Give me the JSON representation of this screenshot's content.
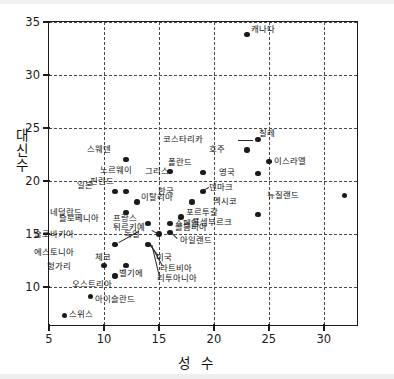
{
  "chart_data": {
    "type": "scatter",
    "title": "",
    "xlabel": "성 수",
    "ylabel": "대신수",
    "ylabel_chars": [
      "대",
      "신",
      "수"
    ],
    "xlim": [
      5,
      33.2
    ],
    "ylim": [
      6.2,
      35
    ],
    "xticks": [
      5,
      10,
      15,
      20,
      25,
      30
    ],
    "yticks": [
      10,
      15,
      20,
      25,
      30,
      35
    ],
    "xtick_labels": [
      "5",
      "10",
      "15",
      "20",
      "25",
      "30"
    ],
    "ytick_labels": [
      "10",
      "15",
      "20",
      "25",
      "30",
      "35"
    ],
    "grid": "dashed both axes",
    "legend": "none",
    "marker_color": "#1b1b1b",
    "axis_color": "#1a1a1a",
    "grid_color": "#4a4a4a",
    "points": [
      {
        "label": "캐나다",
        "x": 23.0,
        "y": 33.8,
        "lx": 0.4,
        "ly": 0.45,
        "leader": false
      },
      {
        "label": "칠레",
        "x": 24.0,
        "y": 23.9,
        "lx": 0.1,
        "ly": 0.55,
        "leader": false
      },
      {
        "label": "코스타리카",
        "x": 24.0,
        "y": 23.9,
        "lx": -4.9,
        "ly": 0.05,
        "leader": true
      },
      {
        "label": "호주",
        "x": 23.0,
        "y": 22.9,
        "lx": -1.9,
        "ly": 0.05,
        "leader": false
      },
      {
        "label": "스웨덴",
        "x": 12.0,
        "y": 22.0,
        "lx": -1.3,
        "ly": 0.95,
        "leader": false
      },
      {
        "label": "이스라엘",
        "x": 25.0,
        "y": 21.8,
        "lx": 0.5,
        "ly": 0.05,
        "leader": false
      },
      {
        "label": "폴란드",
        "x": 19.0,
        "y": 20.8,
        "lx": -0.9,
        "ly": 0.95,
        "leader": false
      },
      {
        "label": "노르웨이",
        "x": 16.0,
        "y": 20.9,
        "lx": -3.4,
        "ly": 0.05,
        "leader": false
      },
      {
        "label": "그리스",
        "x": 19.0,
        "y": 20.8,
        "lx": -3.0,
        "ly": 0.05,
        "leader": false
      },
      {
        "label": "영국",
        "x": 24.0,
        "y": 20.7,
        "lx": -2.0,
        "ly": 0.05,
        "leader": false
      },
      {
        "label": "덴마크",
        "x": 19.0,
        "y": 19.0,
        "lx": 0.6,
        "ly": 0.35,
        "leader": true
      },
      {
        "label": "일본",
        "x": 11.0,
        "y": 19.0,
        "lx": -1.9,
        "ly": 0.55,
        "leader": false
      },
      {
        "label": "핀란드",
        "x": 12.0,
        "y": 19.0,
        "lx": -1.0,
        "ly": 0.95,
        "leader": false
      },
      {
        "label": "뉴질랜드",
        "x": 31.9,
        "y": 18.6,
        "lx": -4.1,
        "ly": 0.05,
        "leader": false
      },
      {
        "label": "이탈리아",
        "x": 13.0,
        "y": 18.0,
        "lx": 0.4,
        "ly": 0.45,
        "leader": false
      },
      {
        "label": "한국",
        "x": 18.0,
        "y": 18.0,
        "lx": -1.5,
        "ly": 0.95,
        "leader": false
      },
      {
        "label": "멕시코",
        "x": 19.0,
        "y": 19.0,
        "lx": 0.9,
        "ly": -0.95,
        "leader": false
      },
      {
        "label": "네덜란드",
        "x": 12.0,
        "y": 17.0,
        "lx": -3.9,
        "ly": 0.05,
        "leader": false
      },
      {
        "label": "포르투갈",
        "x": 17.0,
        "y": 16.6,
        "lx": 0.45,
        "ly": 0.45,
        "leader": false
      },
      {
        "label": "룩셈부르크",
        "x": 24.0,
        "y": 16.8,
        "lx": -2.3,
        "ly": -0.75,
        "leader": false
      },
      {
        "label": "프랑스",
        "x": 16.0,
        "y": 16.0,
        "lx": -2.9,
        "ly": 0.45,
        "leader": false
      },
      {
        "label": "슬로베니아",
        "x": 14.0,
        "y": 16.0,
        "lx": -4.4,
        "ly": 0.45,
        "leader": false
      },
      {
        "label": "스페인",
        "x": 16.0,
        "y": 16.0,
        "lx": 0.45,
        "ly": -0.05,
        "leader": false
      },
      {
        "label": "콜롬비아",
        "x": 16.0,
        "y": 15.1,
        "lx": 0.45,
        "ly": 0.45,
        "leader": false
      },
      {
        "label": "튀르키예",
        "x": 15.0,
        "y": 15.0,
        "lx": -1.2,
        "ly": 0.6,
        "leader": true
      },
      {
        "label": "독일",
        "x": 15.0,
        "y": 15.0,
        "lx": -1.6,
        "ly": -0.05,
        "leader": false
      },
      {
        "label": "아일랜드",
        "x": 16.0,
        "y": 15.1,
        "lx": 0.9,
        "ly": -0.75,
        "leader": true
      },
      {
        "label": "슬로바키아",
        "x": 11.0,
        "y": 14.0,
        "lx": -3.6,
        "ly": 0.95,
        "leader": false
      },
      {
        "label": "미국",
        "x": 14.0,
        "y": 14.0,
        "lx": 0.7,
        "ly": -1.25,
        "leader": true
      },
      {
        "label": "라트비아",
        "x": 14.0,
        "y": 14.0,
        "lx": 1.1,
        "ly": -2.25,
        "leader": true
      },
      {
        "label": "리투아니아",
        "x": 14.0,
        "y": 14.0,
        "lx": 0.8,
        "ly": -3.25,
        "leader": true
      },
      {
        "label": "에스토니아",
        "x": 11.0,
        "y": 14.0,
        "lx": -3.6,
        "ly": -0.75,
        "leader": false
      },
      {
        "label": "체코",
        "x": 12.0,
        "y": 12.0,
        "lx": -1.3,
        "ly": 0.75,
        "leader": false
      },
      {
        "label": "헝가리",
        "x": 10.0,
        "y": 12.0,
        "lx": -2.9,
        "ly": -0.05,
        "leader": false
      },
      {
        "label": "벨기에",
        "x": 11.0,
        "y": 11.0,
        "lx": 0.4,
        "ly": 0.25,
        "leader": false
      },
      {
        "label": "오스트리아",
        "x": 11.0,
        "y": 11.0,
        "lx": -0.2,
        "ly": -0.75,
        "leader": false
      },
      {
        "label": "아이슬란드",
        "x": 8.8,
        "y": 9.1,
        "lx": 0.35,
        "ly": -0.35,
        "leader": false
      },
      {
        "label": "스위스",
        "x": 6.4,
        "y": 7.3,
        "lx": 0.45,
        "ly": 0.05,
        "leader": false
      }
    ],
    "leaders": [
      {
        "from_x": 22.2,
        "from_y": 23.9,
        "to_x": 23.6,
        "to_y": 23.9
      },
      {
        "from_x": 19.6,
        "from_y": 19.3,
        "to_x": 19.15,
        "to_y": 19.05
      },
      {
        "from_x": 16.6,
        "from_y": 14.55,
        "to_x": 16.1,
        "to_y": 15.05
      },
      {
        "from_x": 14.4,
        "from_y": 15.35,
        "to_x": 15.0,
        "to_y": 15.0
      },
      {
        "from_x": 14.9,
        "from_y": 12.95,
        "to_x": 14.1,
        "to_y": 14.0
      },
      {
        "from_x": 15.3,
        "from_y": 11.95,
        "to_x": 14.2,
        "to_y": 14.0
      },
      {
        "from_x": 15.0,
        "from_y": 10.95,
        "to_x": 14.3,
        "to_y": 14.0
      },
      {
        "from_x": 13.2,
        "from_y": 15.15,
        "to_x": 11.35,
        "to_y": 14.1
      }
    ]
  }
}
